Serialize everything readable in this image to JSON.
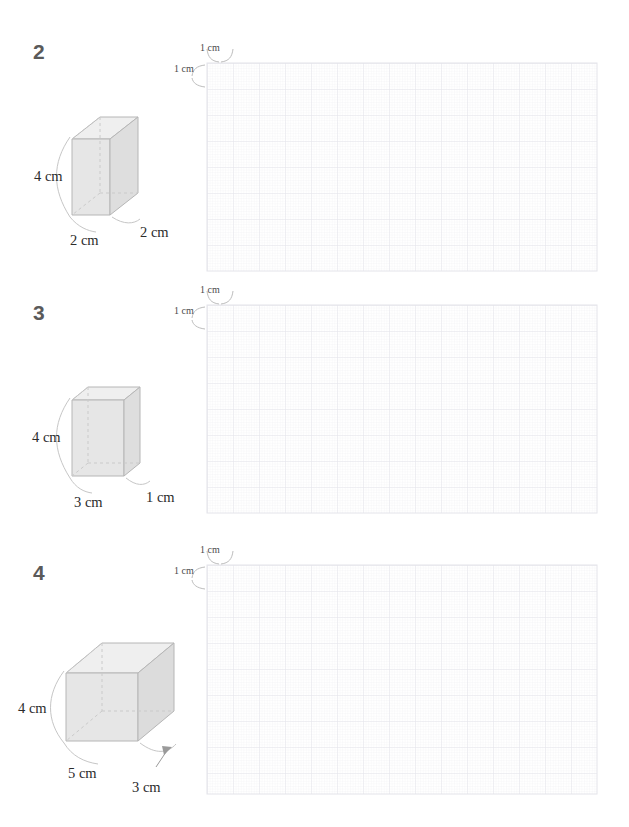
{
  "page": {
    "width": 629,
    "height": 827,
    "background_color": "#ffffff",
    "type": "math-worksheet-volume-of-rectangular-prisms"
  },
  "style": {
    "number_color": "#5a5a5a",
    "text_color": "#2b2b2b",
    "prism_top_face": "#eeeeee",
    "prism_left_face": "#e3e3e3",
    "prism_front_face": "#e9e9e9",
    "prism_stroke": "#b9b9b9",
    "prism_hidden_stroke": "#c9c9c9",
    "grid_major_color": "#e6e6ec",
    "grid_minor_color": "#eeeef3",
    "leader_color": "#c0c0c0"
  },
  "grid": {
    "cell_label_horizontal": "1 cm",
    "cell_label_vertical": "1 cm",
    "cell_size_px": 26,
    "columns": 15,
    "rows": 8,
    "minor_divisions": 10
  },
  "problems": [
    {
      "number": "2",
      "prism": {
        "width_label": "2 cm",
        "depth_label": "2 cm",
        "height_label": "4 cm",
        "width_cm": 2,
        "depth_cm": 2,
        "height_cm": 4
      },
      "grid": {
        "columns": 15,
        "rows": 8,
        "label_h": "1 cm",
        "label_v": "1 cm"
      }
    },
    {
      "number": "3",
      "prism": {
        "width_label": "3 cm",
        "depth_label": "1 cm",
        "height_label": "4 cm",
        "width_cm": 3,
        "depth_cm": 1,
        "height_cm": 4
      },
      "grid": {
        "columns": 15,
        "rows": 8,
        "label_h": "1 cm",
        "label_v": "1 cm"
      }
    },
    {
      "number": "4",
      "prism": {
        "width_label": "5 cm",
        "depth_label": "3 cm",
        "height_label": "4 cm",
        "width_cm": 5,
        "depth_cm": 3,
        "height_cm": 4
      },
      "grid": {
        "columns": 15,
        "rows": 8,
        "label_h": "1 cm",
        "label_v": "1 cm"
      }
    }
  ]
}
